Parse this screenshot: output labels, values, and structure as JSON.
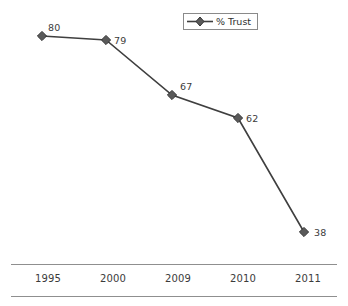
{
  "chart_data": {
    "type": "line",
    "title": "",
    "subtitle": "",
    "xlabel": "",
    "ylabel": "",
    "categories": [
      "1995",
      "2000",
      "2009",
      "2010",
      "2011"
    ],
    "series": [
      {
        "name": "% Trust",
        "values": [
          80,
          79,
          67,
          62,
          38
        ],
        "marker": "diamond",
        "color": "#4d4d4d"
      }
    ],
    "point_labels": [
      "80",
      "79",
      "67",
      "62",
      "38"
    ],
    "ylim": [
      30,
      85
    ],
    "grid": false,
    "legend_position": "top-center",
    "axis_style": "two-horizontal-rules"
  },
  "legend": {
    "entries": [
      {
        "label": "% Trust",
        "marker_icon": "diamond-marker-icon"
      }
    ]
  },
  "axis": {
    "tick_labels": [
      "1995",
      "2000",
      "2009",
      "2010",
      "2011"
    ]
  },
  "colors": {
    "background": "#ffffff",
    "line": "#3f3f3f",
    "marker_fill": "#5a5a5a",
    "marker_stroke": "#333333",
    "text": "#3b3b3b",
    "rule": "#8f8f8f",
    "legend_border": "#8a8a8a"
  },
  "geometry": {
    "points_px": [
      {
        "x": 42,
        "y": 36
      },
      {
        "x": 106,
        "y": 40
      },
      {
        "x": 172,
        "y": 95
      },
      {
        "x": 238,
        "y": 118
      },
      {
        "x": 304,
        "y": 232
      }
    ],
    "label_offsets_px": [
      {
        "dx": 6,
        "dy": -13
      },
      {
        "dx": 8,
        "dy": -4
      },
      {
        "dx": 8,
        "dy": -13
      },
      {
        "dx": 8,
        "dy": -4
      },
      {
        "dx": 10,
        "dy": -4
      }
    ],
    "tick_x_px": [
      48,
      113,
      178,
      243,
      308
    ]
  }
}
